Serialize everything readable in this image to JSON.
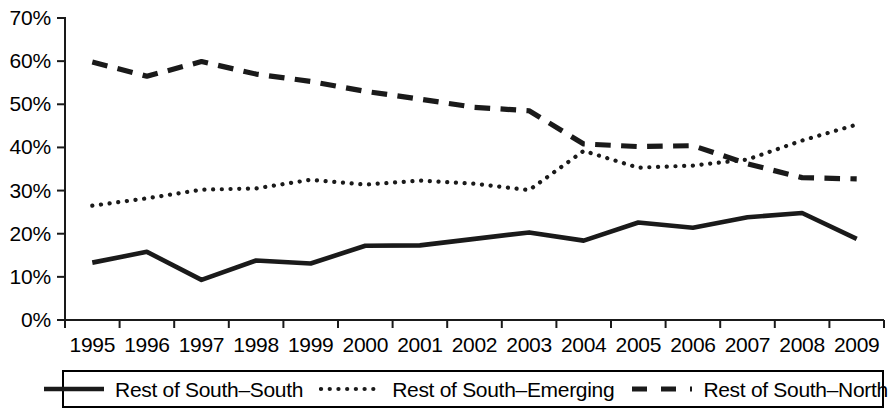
{
  "chart_data": {
    "type": "line",
    "title": "",
    "subtitle": "",
    "xlabel": "",
    "ylabel": "",
    "grid": false,
    "legend_position": "bottom",
    "x": [
      1995,
      1996,
      1997,
      1998,
      1999,
      2000,
      2001,
      2002,
      2003,
      2004,
      2005,
      2006,
      2007,
      2008,
      2009
    ],
    "categories": [
      "1995",
      "1996",
      "1997",
      "1998",
      "1999",
      "2000",
      "2001",
      "2002",
      "2003",
      "2004",
      "2005",
      "2006",
      "2007",
      "2008",
      "2009"
    ],
    "ylim": [
      0,
      70
    ],
    "ytick_values": [
      0,
      10,
      20,
      30,
      40,
      50,
      60,
      70
    ],
    "ytick_labels": [
      "0%",
      "10%",
      "20%",
      "30%",
      "40%",
      "50%",
      "60%",
      "70%"
    ],
    "value_suffix": "%",
    "series": [
      {
        "name": "Rest of South–South",
        "style": "solid",
        "color": "#1a1a1a",
        "values": [
          13.3,
          15.8,
          9.3,
          13.8,
          13.1,
          17.2,
          17.3,
          18.8,
          20.3,
          18.4,
          22.6,
          21.4,
          23.8,
          24.8,
          18.8
        ]
      },
      {
        "name": "Rest of South–Emerging",
        "style": "dotted",
        "color": "#1a1a1a",
        "values": [
          26.5,
          28.2,
          30.2,
          30.5,
          32.5,
          31.4,
          32.3,
          31.6,
          30.1,
          39.2,
          35.3,
          35.8,
          37.2,
          41.6,
          45.3
        ]
      },
      {
        "name": "Rest of South–North",
        "style": "dashed",
        "color": "#1a1a1a",
        "values": [
          59.8,
          56.5,
          59.9,
          57.0,
          55.3,
          53.0,
          51.2,
          49.3,
          48.5,
          40.8,
          40.2,
          40.4,
          36.2,
          33.0,
          32.7
        ]
      }
    ]
  },
  "legend": {
    "items": [
      {
        "label": "Rest of South–South",
        "style": "solid"
      },
      {
        "label": "Rest of South–Emerging",
        "style": "dotted"
      },
      {
        "label": "Rest of South–North",
        "style": "dashed"
      }
    ]
  }
}
